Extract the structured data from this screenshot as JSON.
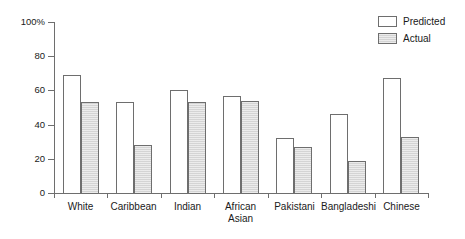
{
  "chart_data": {
    "type": "bar",
    "title": "",
    "subtitle": "",
    "xlabel": "",
    "ylabel": "",
    "ylim": [
      0,
      100
    ],
    "grid": false,
    "legend_position": "top-right",
    "y_ticks": [
      {
        "value": 100,
        "label": "100%"
      },
      {
        "value": 80,
        "label": "80"
      },
      {
        "value": 60,
        "label": "60"
      },
      {
        "value": 40,
        "label": "40"
      },
      {
        "value": 20,
        "label": "20"
      },
      {
        "value": 0,
        "label": "0"
      }
    ],
    "categories": [
      "White",
      "Caribbean",
      "Indian",
      "African\nAsian",
      "Pakistani",
      "Bangladeshi",
      "Chinese"
    ],
    "series": [
      {
        "name": "Predicted",
        "color": "#ffffff",
        "values": [
          69,
          53,
          60,
          57,
          32,
          46,
          67
        ]
      },
      {
        "name": "Actual",
        "color": "#d4d4d4",
        "values": [
          53,
          28,
          53,
          54,
          27,
          19,
          33
        ]
      }
    ],
    "annotations": []
  },
  "legend": {
    "items": [
      {
        "label": "Predicted",
        "style": "predicted"
      },
      {
        "label": "Actual",
        "style": "actual"
      }
    ]
  },
  "axis_color": "#6e6e6e",
  "text_color": "#1a1a1a"
}
